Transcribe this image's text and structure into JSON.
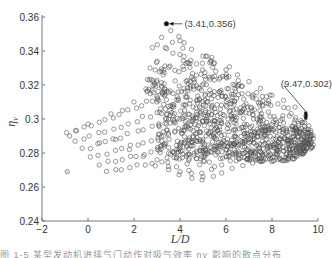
{
  "chart_data": {
    "type": "scatter",
    "title": "",
    "xlabel": "L/D",
    "ylabel": "η_v",
    "xlim": [
      -2,
      10
    ],
    "ylim": [
      0.24,
      0.36
    ],
    "xticks": [
      -2,
      0,
      2,
      4,
      6,
      8,
      10
    ],
    "yticks": [
      0.24,
      0.26,
      0.28,
      0.3,
      0.32,
      0.34,
      0.36
    ],
    "xtick_labels": [
      "−2",
      "0",
      "2",
      "4",
      "6",
      "8",
      "10"
    ],
    "ytick_labels": [
      "0.24",
      "0.26",
      "0.28",
      "0.3",
      "0.32",
      "0.34",
      "0.36"
    ],
    "grid": false,
    "legend": null,
    "marker": "open circle",
    "marker_color": "#555555",
    "annotations": [
      {
        "label": "(3.41,0.356)",
        "x": 3.41,
        "y": 0.356
      },
      {
        "label": "(9.47,0.302)",
        "x": 9.47,
        "y": 0.302
      }
    ],
    "series": [
      {
        "name": "design points",
        "description": "Dense cloud of several hundred points; upper dense wedge from L/D≈2.5–10 peaking at (3.41,0.356); sparse fan of diagonal bands extending left to L/D≈-1 at η≈0.29 and down to η≈0.265 near L/D≈5.",
        "sample_points": [
          [
            3.41,
            0.356
          ],
          [
            3.6,
            0.352
          ],
          [
            3.2,
            0.348
          ],
          [
            4.0,
            0.346
          ],
          [
            2.8,
            0.342
          ],
          [
            4.5,
            0.341
          ],
          [
            5.0,
            0.337
          ],
          [
            5.5,
            0.333
          ],
          [
            6.0,
            0.329
          ],
          [
            6.5,
            0.326
          ],
          [
            7.0,
            0.322
          ],
          [
            7.5,
            0.318
          ],
          [
            8.0,
            0.314
          ],
          [
            8.5,
            0.311
          ],
          [
            9.0,
            0.307
          ],
          [
            9.47,
            0.302
          ],
          [
            9.6,
            0.296
          ],
          [
            9.4,
            0.289
          ],
          [
            9.0,
            0.284
          ],
          [
            8.5,
            0.281
          ],
          [
            2.7,
            0.33
          ],
          [
            2.9,
            0.32
          ],
          [
            3.0,
            0.31
          ],
          [
            3.5,
            0.3
          ],
          [
            4.2,
            0.305
          ],
          [
            5.2,
            0.31
          ],
          [
            6.2,
            0.305
          ],
          [
            7.2,
            0.3
          ],
          [
            8.2,
            0.298
          ],
          [
            1.0,
            0.303
          ],
          [
            0.0,
            0.297
          ],
          [
            -0.5,
            0.293
          ],
          [
            -0.8,
            0.29
          ],
          [
            1.5,
            0.305
          ],
          [
            2.0,
            0.31
          ],
          [
            0.5,
            0.286
          ],
          [
            1.2,
            0.288
          ],
          [
            1.8,
            0.282
          ],
          [
            2.4,
            0.278
          ],
          [
            3.0,
            0.276
          ],
          [
            3.5,
            0.272
          ],
          [
            4.0,
            0.269
          ],
          [
            4.5,
            0.268
          ],
          [
            5.0,
            0.266
          ],
          [
            5.5,
            0.272
          ],
          [
            6.0,
            0.278
          ],
          [
            7.0,
            0.283
          ],
          [
            -0.9,
            0.269
          ]
        ]
      }
    ]
  },
  "caption": "图 1-5  某型发动机进排气门动作对吸气效率 ηv 影响的散点分布"
}
